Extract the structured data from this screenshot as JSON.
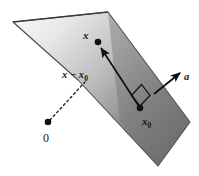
{
  "figure": {
    "name": "hyperplane-point-projection-diagram",
    "background_color": "#ffffff",
    "width": 199,
    "height": 176,
    "plane": {
      "name": "hyperplane",
      "edge_color": "#4a4a4a",
      "fill_light": "#f2f2f2",
      "fill_mid": "#b4b4b4",
      "fill_dark": "#6e6e6e",
      "vertices": [
        [
          13,
          22
        ],
        [
          108,
          12
        ],
        [
          190,
          122
        ],
        [
          158,
          166
        ],
        [
          78,
          80
        ]
      ]
    },
    "points": [
      {
        "id": "point-x",
        "label": "x",
        "cx": 98,
        "cy": 42,
        "r": 3.2,
        "label_x": 84,
        "label_y": 36,
        "color": "#111111"
      },
      {
        "id": "point-x0",
        "label": "x",
        "sub": "0",
        "cx": 140,
        "cy": 108,
        "r": 3.2,
        "label_x": 143,
        "label_y": 124,
        "color": "#111111"
      },
      {
        "id": "point-origin",
        "label": "0",
        "cx": 48,
        "cy": 122,
        "r": 3.2,
        "label_x": 44,
        "label_y": 141,
        "color": "#111111"
      }
    ],
    "vectors": [
      {
        "id": "vector-x-minus-x0",
        "label": "x − x",
        "sub": "0",
        "from": [
          140,
          108
        ],
        "to": [
          100,
          47
        ],
        "label_x": 63,
        "label_y": 76,
        "color": "#111111"
      },
      {
        "id": "vector-a-normal",
        "label": "a",
        "from": [
          155,
          93
        ],
        "to": [
          181,
          72
        ],
        "label_x": 185,
        "label_y": 79,
        "color": "#111111"
      }
    ],
    "dashed_line": {
      "id": "origin-to-plane-dashed",
      "from": [
        50,
        120
      ],
      "to": [
        85,
        82
      ],
      "color": "#222222",
      "dash": "2 3"
    },
    "right_angle": {
      "id": "right-angle-marker",
      "points": "132,95 142,85 150,96 140,105",
      "color": "#111111"
    }
  }
}
